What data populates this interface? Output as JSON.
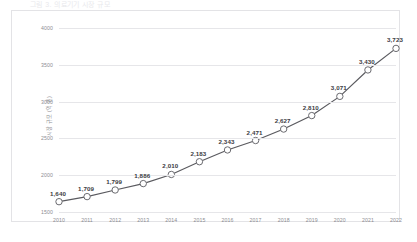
{
  "page": {
    "cropped_title": "그림 3. 의료기기 시장 규모"
  },
  "chart_data": {
    "type": "line",
    "title": "",
    "xlabel": "",
    "ylabel": "시장 규모 (억 원)",
    "categories": [
      "2010",
      "2011",
      "2012",
      "2013",
      "2014",
      "2015",
      "2016",
      "2017",
      "2018",
      "2019",
      "2020",
      "2021",
      "2022"
    ],
    "values": [
      1640,
      1709,
      1799,
      1886,
      2010,
      2183,
      2343,
      2471,
      2627,
      2810,
      3071,
      3430,
      3723
    ],
    "data_labels": [
      "1,640",
      "1,709",
      "1,799",
      "1,886",
      "2,010",
      "2,183",
      "2,343",
      "2,471",
      "2,627",
      "2,810",
      "3,071",
      "3,430",
      "3,723"
    ],
    "ylim": [
      1500,
      4000
    ],
    "yticks": [
      1500,
      2000,
      2500,
      3000,
      3500,
      4000
    ],
    "ytick_labels": [
      "1500",
      "2000",
      "2500",
      "3000",
      "3500",
      "4000"
    ],
    "grid": true,
    "legend": "none",
    "series_color": "#5a5a5f",
    "marker_fill": "#ffffff",
    "marker_edge": "#6b6b70"
  }
}
